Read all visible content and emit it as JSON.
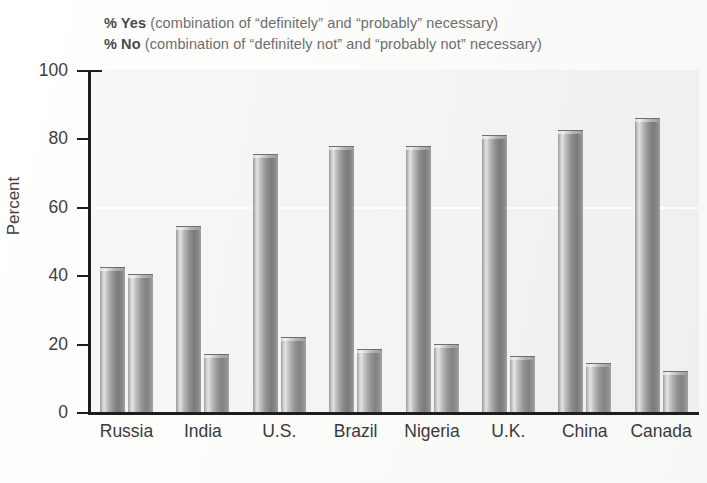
{
  "legend": {
    "yes": {
      "key": "% Yes",
      "desc": " (combination of “definitely” and “probably” necessary)"
    },
    "no": {
      "key": "% No",
      "desc": " (combination of “definitely not” and “probably not” necessary)"
    }
  },
  "axis": {
    "y_title": "Percent",
    "y_ticks": [
      "100",
      "80",
      "60",
      "40",
      "20",
      "0"
    ]
  },
  "chart_data": {
    "type": "bar",
    "title": "",
    "xlabel": "",
    "ylabel": "Percent",
    "ylim": [
      0,
      100
    ],
    "ytick_values": [
      0,
      20,
      40,
      60,
      80,
      100
    ],
    "grid": false,
    "legend_position": "top-left",
    "categories": [
      "Russia",
      "India",
      "U.S.",
      "Brazil",
      "Nigeria",
      "U.K.",
      "China",
      "Canada"
    ],
    "series": [
      {
        "name": "% Yes",
        "values": [
          43,
          55,
          76,
          78.5,
          78.5,
          81.5,
          83,
          86.5
        ]
      },
      {
        "name": "% No",
        "values": [
          41,
          17.5,
          22.5,
          19,
          20.5,
          17,
          15,
          12.5
        ]
      }
    ],
    "annotations": [
      "% Yes (combination of “definitely” and “probably” necessary)",
      "% No (combination of “definitely not” and “probably not” necessary)"
    ],
    "colors": {
      "yes_bar": "#8d8d8d",
      "no_bar": "#949494",
      "axis": "#1d1d1d",
      "background": "#f4f4f2"
    }
  }
}
